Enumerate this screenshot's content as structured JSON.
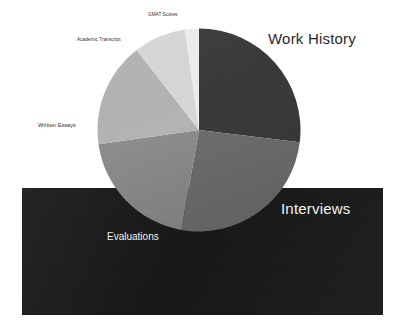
{
  "canvas": {
    "width": 405,
    "height": 336,
    "background": "#ffffff"
  },
  "panel": {
    "name": "dark-backing-panel",
    "color": "#1c1c1c"
  },
  "chart_data": {
    "type": "pie",
    "title": "",
    "subtitle": "",
    "xlabel": "",
    "ylabel": "",
    "legend_position": "none",
    "labels_placement": "outside-and-overlay",
    "start_angle_deg": 0,
    "direction": "clockwise",
    "categories": [
      "Work History",
      "Interviews",
      "Evaluations",
      "Written Essays",
      "Academic Transcript",
      "GMAT Scores"
    ],
    "values": [
      27,
      26,
      20,
      17,
      8,
      2
    ],
    "units": "percent",
    "slices": [
      {
        "label": "Work History",
        "value": 27,
        "start_deg": 0,
        "end_deg": 97,
        "color": "#3a3a3a",
        "label_color": "#2a2a2a",
        "label_size": "large"
      },
      {
        "label": "Interviews",
        "value": 26,
        "start_deg": 97,
        "end_deg": 190,
        "color": "#6e6e6e",
        "label_color": "#f2f2f2",
        "label_size": "large"
      },
      {
        "label": "Evaluations",
        "value": 20,
        "start_deg": 190,
        "end_deg": 262,
        "color": "#8c8c8c",
        "label_color": "#f2f2f2",
        "label_size": "medium"
      },
      {
        "label": "Written Essays",
        "value": 17,
        "start_deg": 262,
        "end_deg": 322,
        "color": "#b4b4b4",
        "label_color": "#2a2a2a",
        "label_size": "small"
      },
      {
        "label": "Academic Transcript",
        "value": 8,
        "start_deg": 322,
        "end_deg": 352,
        "color": "#d8d8d8",
        "label_color": "#2a2a2a",
        "label_size": "small"
      },
      {
        "label": "GMAT Scores",
        "value": 2,
        "start_deg": 352,
        "end_deg": 360,
        "color": "#eeeeee",
        "label_color": "#2a2a2a",
        "label_size": "xsmall"
      }
    ],
    "geometry": {
      "center_x": 199,
      "center_y": 130,
      "radius": 102
    }
  }
}
